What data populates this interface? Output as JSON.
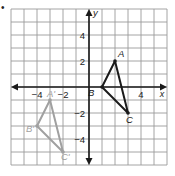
{
  "bullet": "•",
  "plane": {
    "origin_px": [
      89,
      87
    ],
    "unit_px": 13,
    "x_range": [
      -6,
      6
    ],
    "y_range": [
      -6,
      6
    ],
    "grid_color": "#9a9a9a",
    "axis_color": "#1a1a1a"
  },
  "axes": {
    "x_label": "x",
    "y_label": "y",
    "x_ticks": [
      {
        "value": -4,
        "label": "−4"
      },
      {
        "value": -2,
        "label": "−2"
      },
      {
        "value": 4,
        "label": "4"
      }
    ],
    "y_ticks": [
      {
        "value": 4,
        "label": "4"
      },
      {
        "value": 2,
        "label": "2"
      },
      {
        "value": -2,
        "label": "−2"
      },
      {
        "value": -4,
        "label": "−4"
      }
    ]
  },
  "triangles": [
    {
      "name": "ABC",
      "color": "#1a1a1a",
      "vertices": [
        {
          "label": "A",
          "x": 2,
          "y": 2
        },
        {
          "label": "B",
          "x": 1,
          "y": 0
        },
        {
          "label": "C",
          "x": 3,
          "y": -2
        }
      ]
    },
    {
      "name": "A'B'C'",
      "color": "#a0a0a0",
      "vertices": [
        {
          "label": "A'",
          "x": -3,
          "y": -1
        },
        {
          "label": "B'",
          "x": -4,
          "y": -3
        },
        {
          "label": "C'",
          "x": -2,
          "y": -5
        }
      ]
    }
  ]
}
